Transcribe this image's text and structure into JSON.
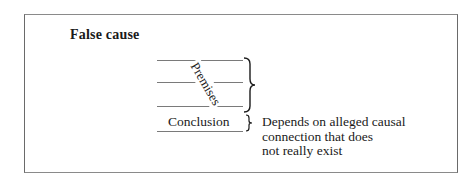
{
  "diagram": {
    "title": "False cause",
    "premises_label": "Premises",
    "premise_line_count": 3,
    "conclusion_label": "Conclusion",
    "explanation_lines": [
      "Depends on alleged causal",
      "connection that does",
      "not really exist"
    ]
  }
}
